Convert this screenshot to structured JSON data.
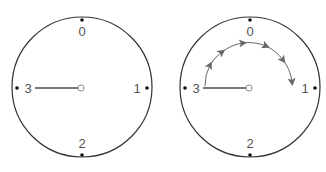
{
  "diagram": {
    "type": "clock-dial-comparison",
    "colors": {
      "circle_stroke": "#333333",
      "hand": "#777777",
      "arrow": "#666666",
      "label": "#555555",
      "dot": "#111111"
    },
    "dials": [
      {
        "id": "left",
        "labels": {
          "top": "0",
          "right": "1",
          "bottom": "2",
          "left": "3"
        },
        "hand_points_to": "3",
        "has_rotation_arrow": false
      },
      {
        "id": "right",
        "labels": {
          "top": "0",
          "right": "1",
          "bottom": "2",
          "left": "3"
        },
        "hand_points_to": "3",
        "has_rotation_arrow": true,
        "rotation": {
          "from": "3",
          "via": "0",
          "to": "1",
          "direction": "clockwise"
        }
      }
    ]
  }
}
